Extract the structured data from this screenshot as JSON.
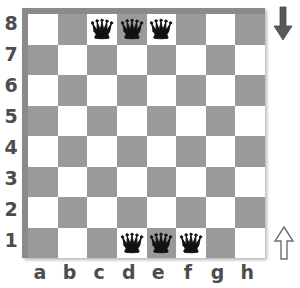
{
  "board": {
    "title": "chessboard",
    "colors": {
      "light_square": "#ffffff",
      "dark_square": "#9a9a9a",
      "frame": "#8a8a8a",
      "label": "#4d4d4d",
      "piece_black": "#111111",
      "arrow_down": "#585858",
      "arrow_up_fill": "#ffffff",
      "arrow_up_stroke": "#6e6e6e"
    },
    "files": [
      "a",
      "b",
      "c",
      "d",
      "e",
      "f",
      "g",
      "h"
    ],
    "ranks": [
      "8",
      "7",
      "6",
      "5",
      "4",
      "3",
      "2",
      "1"
    ],
    "squares": [
      [
        "light",
        "dark",
        "light",
        "dark",
        "light",
        "dark",
        "light",
        "dark"
      ],
      [
        "dark",
        "light",
        "dark",
        "light",
        "dark",
        "light",
        "dark",
        "light"
      ],
      [
        "light",
        "dark",
        "light",
        "dark",
        "light",
        "dark",
        "light",
        "dark"
      ],
      [
        "dark",
        "light",
        "dark",
        "light",
        "dark",
        "light",
        "dark",
        "light"
      ],
      [
        "light",
        "dark",
        "light",
        "dark",
        "light",
        "dark",
        "light",
        "dark"
      ],
      [
        "dark",
        "light",
        "dark",
        "light",
        "dark",
        "light",
        "dark",
        "light"
      ],
      [
        "light",
        "dark",
        "light",
        "dark",
        "light",
        "dark",
        "light",
        "dark"
      ],
      [
        "dark",
        "light",
        "dark",
        "light",
        "dark",
        "light",
        "dark",
        "light"
      ]
    ],
    "pieces": [
      {
        "square": "c8",
        "rank": "8",
        "file": "c",
        "piece": "queen",
        "color": "black",
        "glyph": "black-queen-icon"
      },
      {
        "square": "d8",
        "rank": "8",
        "file": "d",
        "piece": "queen",
        "color": "black",
        "glyph": "black-queen-icon"
      },
      {
        "square": "e8",
        "rank": "8",
        "file": "e",
        "piece": "queen",
        "color": "black",
        "glyph": "black-queen-icon"
      },
      {
        "square": "d1",
        "rank": "1",
        "file": "d",
        "piece": "queen",
        "color": "black",
        "glyph": "black-queen-icon"
      },
      {
        "square": "e1",
        "rank": "1",
        "file": "e",
        "piece": "queen",
        "color": "black",
        "glyph": "black-queen-icon"
      },
      {
        "square": "f1",
        "rank": "1",
        "file": "f",
        "piece": "queen",
        "color": "black",
        "glyph": "black-queen-icon"
      }
    ]
  },
  "annotations": {
    "arrow_down": {
      "name": "arrow-down-icon",
      "direction": "down",
      "style": "solid",
      "position": "top-right"
    },
    "arrow_up": {
      "name": "arrow-up-icon",
      "direction": "up",
      "style": "outline",
      "position": "bottom-right"
    }
  }
}
